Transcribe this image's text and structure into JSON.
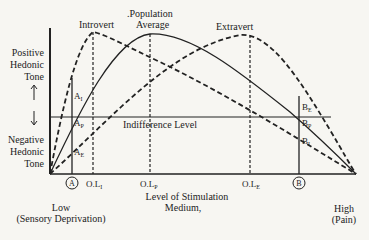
{
  "diagram": {
    "y_axis": {
      "positive_label": [
        "Positive",
        "Hedonic",
        "Tone"
      ],
      "negative_label": [
        "Negative",
        "Hedonic",
        "Tone"
      ]
    },
    "indifference_label": "Indifference Level",
    "curves": [
      {
        "name": "Introvert",
        "style": "dashed",
        "peak_label": "Introvert"
      },
      {
        "name": "Population Average",
        "style": "solid",
        "peak_label_1": ".Population",
        "peak_label_2": "Average"
      },
      {
        "name": "Extravert",
        "style": "dashed",
        "peak_label": "Extravert"
      }
    ],
    "points": {
      "A": "A",
      "B": "B",
      "A_I": "A",
      "A_I_sub": "I",
      "A_P": "A",
      "A_P_sub": "P",
      "A_E": "A",
      "A_E_sub": "E",
      "B_E": "B",
      "B_E_sub": "E",
      "B_P": "B",
      "B_P_sub": "P",
      "B_I": "B",
      "B_I_sub": "I"
    },
    "x_ticks": {
      "ol_i": "O.L",
      "ol_i_sub": "I",
      "ol_p": "O.L",
      "ol_p_sub": "P",
      "ol_e": "O.L",
      "ol_e_sub": "E"
    },
    "x_axis": {
      "title_1": "Level of Stimulation",
      "title_2": "Medium,",
      "low_1": "Low",
      "low_2": "(Sensory Deprivation)",
      "high_1": "High",
      "high_2": "(Pain)"
    }
  }
}
